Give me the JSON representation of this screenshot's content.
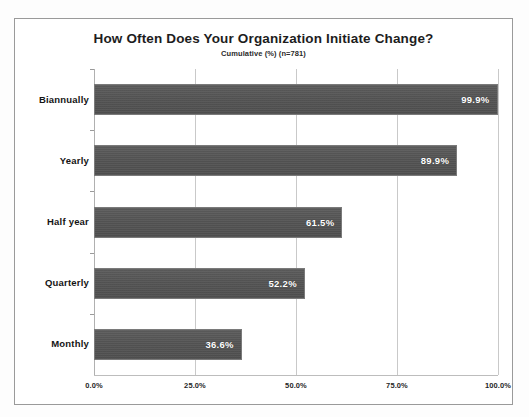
{
  "chart_data": {
    "type": "bar",
    "orientation": "horizontal",
    "title": "How Often Does Your Organization Initiate Change?",
    "subtitle": "Cumulative (%) (n=781)",
    "xlabel": "",
    "ylabel": "",
    "xlim": [
      0,
      100
    ],
    "grid": true,
    "legend": "none",
    "categories": [
      "Biannually",
      "Yearly",
      "Half year",
      "Quarterly",
      "Monthly"
    ],
    "values": [
      99.9,
      89.9,
      61.5,
      52.2,
      36.6
    ],
    "data_labels": [
      "99.9%",
      "89.9%",
      "61.5%",
      "52.2%",
      "36.6%"
    ],
    "xticks": [
      0,
      25,
      50,
      75,
      100
    ],
    "xtick_labels": [
      "0.0%",
      "25.0%",
      "50.0%",
      "75.0%",
      "100.0%"
    ],
    "bar_color": "#545454",
    "bar_border_color": "#7a7a7a",
    "data_label_color": "#ffffff",
    "plot_background": "#ffffff",
    "gridline_color": "#c9c9c9",
    "frame_border_color": "#9a9a9a"
  }
}
